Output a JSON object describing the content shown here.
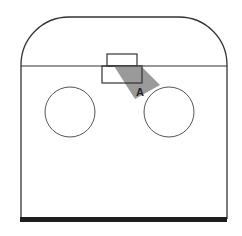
{
  "diagram": {
    "colors": {
      "stroke": "#333333",
      "shaded_region": "#9a9a9a",
      "baseline": "#1e1e1e",
      "background": "#ffffff"
    },
    "labels": {
      "region_a": "A"
    },
    "shapes": {
      "outer_boundary": {
        "left": 21,
        "right": 227,
        "top": 17,
        "bottom": 219,
        "corner_radius": 48
      },
      "goal_line_y": 66,
      "goal_box": {
        "x": 107,
        "y": 54,
        "width": 30,
        "height": 12
      },
      "crease_box": {
        "x": 102,
        "y": 66,
        "width": 40,
        "height": 17
      },
      "left_circle": {
        "cx": 70,
        "cy": 112,
        "r": 25
      },
      "right_circle": {
        "cx": 169,
        "cy": 112,
        "r": 25
      },
      "shaded_region_points": "114,66 141,66 160,85 135,99",
      "region_a_label_pos": {
        "x": 136,
        "y": 96
      },
      "baseline": {
        "x": 20,
        "y": 217,
        "width": 206,
        "height": 5
      }
    }
  }
}
